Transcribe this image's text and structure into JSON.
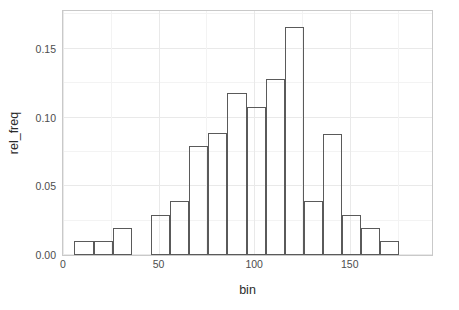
{
  "chart_data": {
    "type": "bar",
    "title": "",
    "subtitle": "",
    "xlabel": "bin",
    "ylabel": "rel_freq",
    "grid": true,
    "legend": null,
    "xlim": [
      0,
      193
    ],
    "ylim": [
      0,
      0.1775
    ],
    "xticks": [
      0,
      50,
      100,
      150
    ],
    "xtick_labels": [
      "0",
      "50",
      "100",
      "150"
    ],
    "yticks": [
      0.0,
      0.05,
      0.1,
      0.15
    ],
    "ytick_labels": [
      "0.00",
      "0.05",
      "0.10",
      "0.15"
    ],
    "bin_width": 10,
    "bar_style": {
      "fill": "none",
      "edge_color": "#5a5a5a"
    },
    "bins": [
      {
        "left": 6,
        "right": 16,
        "center": 11,
        "value": 0.01
      },
      {
        "left": 16,
        "right": 26,
        "center": 21,
        "value": 0.01
      },
      {
        "left": 26,
        "right": 36,
        "center": 31,
        "value": 0.02
      },
      {
        "left": 46,
        "right": 56,
        "center": 51,
        "value": 0.029
      },
      {
        "left": 56,
        "right": 66,
        "center": 61,
        "value": 0.039
      },
      {
        "left": 66,
        "right": 76,
        "center": 71,
        "value": 0.079
      },
      {
        "left": 76,
        "right": 86,
        "center": 81,
        "value": 0.089
      },
      {
        "left": 86,
        "right": 96,
        "center": 91,
        "value": 0.118
      },
      {
        "left": 96,
        "right": 106,
        "center": 101,
        "value": 0.108
      },
      {
        "left": 106,
        "right": 116,
        "center": 111,
        "value": 0.128
      },
      {
        "left": 116,
        "right": 126,
        "center": 121,
        "value": 0.166
      },
      {
        "left": 126,
        "right": 136,
        "center": 131,
        "value": 0.039
      },
      {
        "left": 136,
        "right": 146,
        "center": 141,
        "value": 0.088
      },
      {
        "left": 146,
        "right": 156,
        "center": 151,
        "value": 0.029
      },
      {
        "left": 156,
        "right": 166,
        "center": 161,
        "value": 0.02
      },
      {
        "left": 166,
        "right": 176,
        "center": 171,
        "value": 0.01
      }
    ],
    "categories": [
      11,
      21,
      31,
      51,
      61,
      71,
      81,
      91,
      101,
      111,
      121,
      131,
      141,
      151,
      161,
      171
    ],
    "values": [
      0.01,
      0.01,
      0.02,
      0.029,
      0.039,
      0.079,
      0.089,
      0.118,
      0.108,
      0.128,
      0.166,
      0.039,
      0.088,
      0.029,
      0.02,
      0.01
    ]
  }
}
